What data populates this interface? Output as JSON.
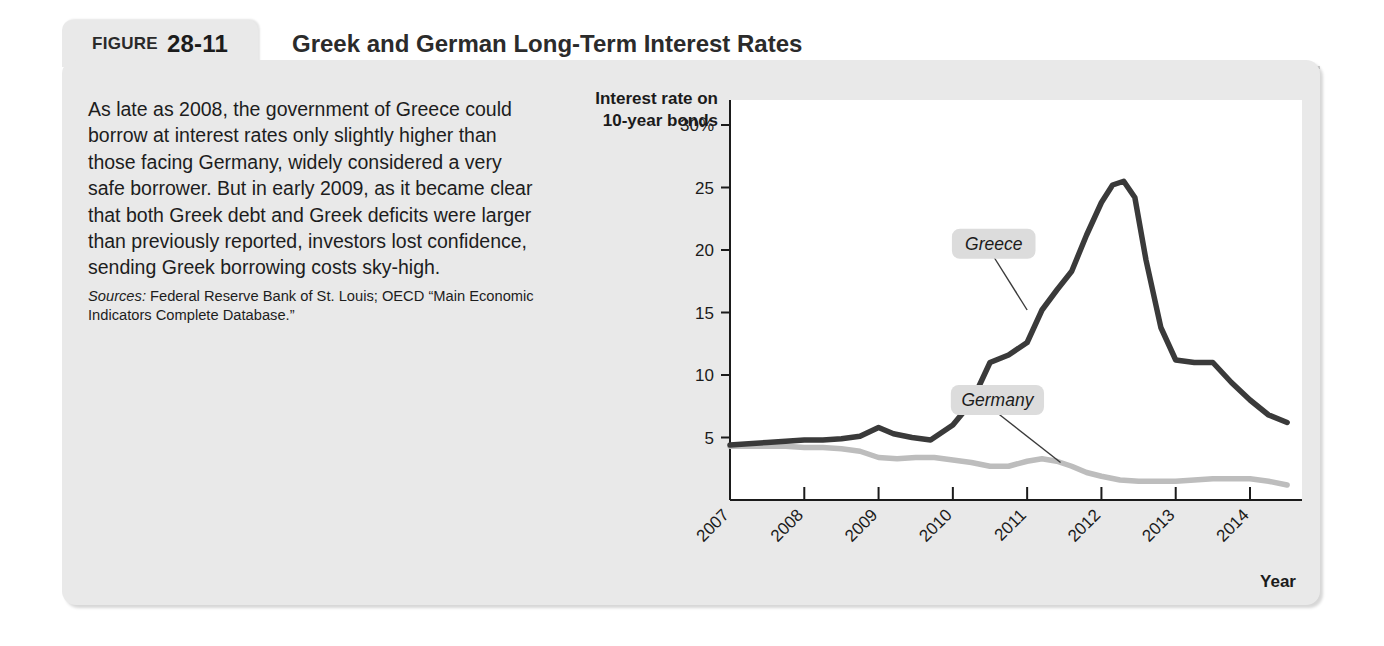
{
  "figure": {
    "label_word": "FIGURE",
    "number": "28-11",
    "title": "Greek and German Long-Term Interest Rates"
  },
  "description": {
    "paragraph": "As late as 2008, the government of Greece could borrow at interest rates only slightly higher than those facing Germany, widely considered a very safe borrower. But in early 2009, as it became clear that both Greek debt and Greek deficits were larger than previously reported, investors lost confidence, sending Greek borrowing costs sky-high.",
    "sources_label": "Sources:",
    "sources_text": " Federal Reserve Bank of St. Louis; OECD “Main Economic Indicators Complete Database.”"
  },
  "chart_data": {
    "type": "line",
    "title": "Greek and German Long-Term Interest Rates",
    "xlabel": "Year",
    "ylabel": "Interest rate on 10-year bonds",
    "ytick_labels": [
      "30%",
      "25",
      "20",
      "15",
      "10",
      "5"
    ],
    "ytick_values": [
      30,
      25,
      20,
      15,
      10,
      5
    ],
    "ylim": [
      0,
      32
    ],
    "xlim": [
      2007.0,
      2014.7
    ],
    "xtick_labels": [
      "2007",
      "2008",
      "2009",
      "2010",
      "2011",
      "2012",
      "2013",
      "2014"
    ],
    "xtick_values": [
      2007,
      2008,
      2009,
      2010,
      2011,
      2012,
      2013,
      2014
    ],
    "grid": false,
    "legend": "inline-callouts",
    "series": [
      {
        "name": "Greece",
        "color": "#3a3a3a",
        "x": [
          2007.0,
          2007.25,
          2007.5,
          2007.75,
          2008.0,
          2008.25,
          2008.5,
          2008.75,
          2009.0,
          2009.2,
          2009.45,
          2009.7,
          2010.0,
          2010.25,
          2010.5,
          2010.75,
          2011.0,
          2011.2,
          2011.4,
          2011.6,
          2011.8,
          2012.0,
          2012.15,
          2012.3,
          2012.45,
          2012.6,
          2012.8,
          2013.0,
          2013.25,
          2013.5,
          2013.75,
          2014.0,
          2014.25,
          2014.5
        ],
        "values": [
          4.4,
          4.5,
          4.6,
          4.7,
          4.8,
          4.8,
          4.9,
          5.1,
          5.8,
          5.3,
          5.0,
          4.8,
          6.0,
          7.8,
          11.0,
          11.6,
          12.6,
          15.2,
          16.8,
          18.3,
          21.2,
          23.8,
          25.2,
          25.5,
          24.2,
          19.2,
          13.8,
          11.2,
          11.0,
          11.0,
          9.4,
          8.0,
          6.8,
          6.2
        ]
      },
      {
        "name": "Germany",
        "color": "#bdbdbd",
        "x": [
          2007.0,
          2007.25,
          2007.5,
          2007.75,
          2008.0,
          2008.25,
          2008.5,
          2008.75,
          2009.0,
          2009.25,
          2009.5,
          2009.75,
          2010.0,
          2010.25,
          2010.5,
          2010.75,
          2011.0,
          2011.2,
          2011.4,
          2011.6,
          2011.8,
          2012.0,
          2012.25,
          2012.5,
          2012.75,
          2013.0,
          2013.25,
          2013.5,
          2013.75,
          2014.0,
          2014.25,
          2014.5
        ],
        "values": [
          4.3,
          4.3,
          4.3,
          4.3,
          4.2,
          4.2,
          4.1,
          3.9,
          3.4,
          3.3,
          3.4,
          3.4,
          3.2,
          3.0,
          2.7,
          2.7,
          3.1,
          3.3,
          3.1,
          2.7,
          2.2,
          1.9,
          1.6,
          1.5,
          1.5,
          1.5,
          1.6,
          1.7,
          1.7,
          1.7,
          1.5,
          1.2
        ]
      }
    ],
    "annotations": [
      {
        "text": "Greece",
        "x": 2010.55,
        "y": 20.5
      },
      {
        "text": "Germany",
        "x": 2010.6,
        "y": 8.0
      }
    ]
  },
  "colors": {
    "panel_background": "#e9e9e9",
    "plot_background": "#ffffff",
    "greece_line": "#3a3a3a",
    "germany_line": "#bdbdbd",
    "axis": "#1b1b1b",
    "callout_background": "#dcdcdc"
  }
}
